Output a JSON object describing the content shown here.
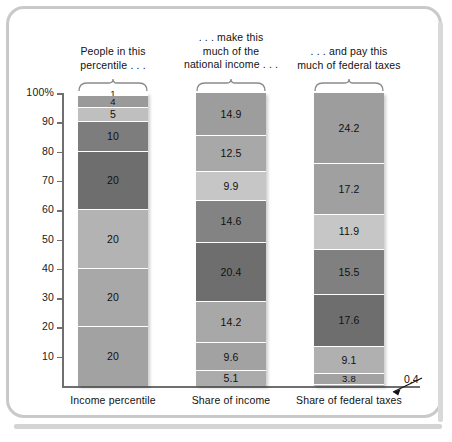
{
  "chart_data": {
    "type": "bar",
    "subtype": "stacked-100-percent",
    "title": "",
    "xlabel": "",
    "ylabel": "",
    "ylim": [
      0,
      100
    ],
    "grid": false,
    "legend": "none",
    "ytick_labels": [
      "100%",
      "90",
      "80",
      "70",
      "60",
      "50",
      "40",
      "30",
      "20",
      "10"
    ],
    "ytick_values": [
      100,
      90,
      80,
      70,
      60,
      50,
      40,
      30,
      20,
      10
    ],
    "categories": [
      "Income percentile",
      "Share of income",
      "Share of federal taxes"
    ],
    "captions": [
      "People in this percentile . . .",
      ". . . make this much of the national income . . .",
      ". . . and pay this much of federal taxes"
    ],
    "series": [
      {
        "name": "Income percentile",
        "axis_label": "Income percentile",
        "caption_lines": [
          "People in this",
          "percentile . . ."
        ],
        "segments": [
          {
            "label": "1",
            "value": 1,
            "color": "#ffffff"
          },
          {
            "label": "4",
            "value": 4,
            "color": "#9a9a9a"
          },
          {
            "label": "5",
            "value": 5,
            "color": "#bfbfbf"
          },
          {
            "label": "10",
            "value": 10,
            "color": "#7d7d7d"
          },
          {
            "label": "20",
            "value": 20,
            "color": "#6e6e6e"
          },
          {
            "label": "20",
            "value": 20,
            "color": "#b3b3b3"
          },
          {
            "label": "20",
            "value": 20,
            "color": "#a8a8a8"
          },
          {
            "label": "20",
            "value": 20,
            "color": "#a2a2a2"
          }
        ]
      },
      {
        "name": "Share of income",
        "axis_label": "Share of income",
        "caption_lines": [
          ". . . make this",
          "much of the",
          "national income . . ."
        ],
        "segments": [
          {
            "label": "14.9",
            "value": 14.9,
            "color": "#9d9d9d"
          },
          {
            "label": "12.5",
            "value": 12.5,
            "color": "#a8a8a8"
          },
          {
            "label": "9.9",
            "value": 9.9,
            "color": "#c6c6c6"
          },
          {
            "label": "14.6",
            "value": 14.6,
            "color": "#838383"
          },
          {
            "label": "20.4",
            "value": 20.4,
            "color": "#6e6e6e"
          },
          {
            "label": "14.2",
            "value": 14.2,
            "color": "#a8a8a8"
          },
          {
            "label": "9.6",
            "value": 9.6,
            "color": "#a2a2a2"
          },
          {
            "label": "5.1",
            "value": 5.1,
            "color": "#ababab"
          }
        ]
      },
      {
        "name": "Share of federal taxes",
        "axis_label": "Share of federal taxes",
        "caption_lines": [
          ". . . and pay this",
          "much of federal taxes"
        ],
        "segments": [
          {
            "label": "24.2",
            "value": 24.2,
            "color": "#9d9d9d"
          },
          {
            "label": "17.2",
            "value": 17.2,
            "color": "#a0a0a0"
          },
          {
            "label": "11.9",
            "value": 11.9,
            "color": "#c6c6c6"
          },
          {
            "label": "15.5",
            "value": 15.5,
            "color": "#808080"
          },
          {
            "label": "17.6",
            "value": 17.6,
            "color": "#6e6e6e"
          },
          {
            "label": "9.1",
            "value": 9.1,
            "color": "#b0b0b0"
          },
          {
            "label": "3.8",
            "value": 3.8,
            "color": "#a2a2a2"
          },
          {
            "label": "0.4",
            "value": 0.4,
            "color": "#b5b5b5"
          }
        ]
      }
    ],
    "annotations": [
      {
        "text": "0.4",
        "target_series": "Share of federal taxes",
        "target_segment_index": 7
      }
    ]
  },
  "colors": {
    "frame": "#c9c9c9",
    "axis": "#6f6f6f",
    "text": "#111111",
    "segment_divider": "#ffffff"
  },
  "callout": {
    "text": "0.4"
  }
}
